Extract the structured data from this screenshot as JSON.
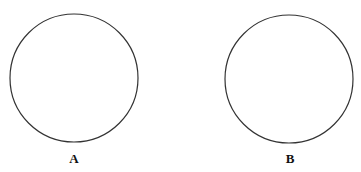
{
  "diagram": {
    "circles": [
      {
        "label": "A",
        "cx": 74,
        "cy": 78,
        "r": 64
      },
      {
        "label": "B",
        "cx": 289,
        "cy": 79,
        "r": 64
      }
    ],
    "stroke_color": "#333333"
  }
}
